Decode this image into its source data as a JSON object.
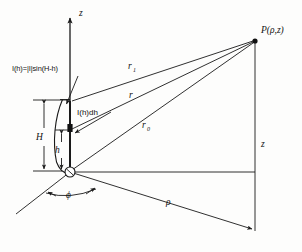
{
  "figure": {
    "kind": "antenna-radiation-geometry-diagram",
    "background_color": "#fdfdfc",
    "line_color": "#1a1a1a",
    "labels": {
      "z_axis": "z",
      "z_vertical": "z",
      "rho": "ρ",
      "phi": "ϕ",
      "point_p": "P(ρ,z)",
      "r_one": "r",
      "r_one_sub": "1",
      "r_mid": "r",
      "r_zero": "r",
      "r_zero_sub": "0",
      "height_H": "H",
      "height_h": "h",
      "element": "I(h)dh",
      "distribution_formula": "I(h)=|I|sin(H-h)"
    },
    "geometry": {
      "origin": {
        "x": 70,
        "y": 172
      },
      "point_p": {
        "x": 255,
        "y": 41
      },
      "z_axis_top": {
        "x": 70,
        "y": 14
      },
      "rho_end": {
        "x": 255,
        "y": 230
      },
      "ground_left_end": {
        "x": 16,
        "y": 214
      },
      "element_position": {
        "x": 70,
        "y": 128
      },
      "H_top": {
        "y": 100
      },
      "h_top": {
        "y": 128
      }
    }
  }
}
